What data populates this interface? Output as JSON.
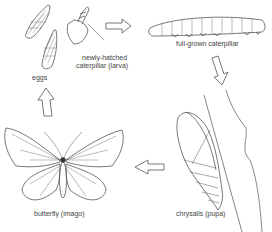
{
  "diagram": {
    "type": "life-cycle",
    "subject": "butterfly",
    "stages": [
      {
        "id": "eggs",
        "label": "eggs"
      },
      {
        "id": "larva",
        "label_line1": "newly-hatched",
        "label_line2": "caterpillar (larva)"
      },
      {
        "id": "caterpillar",
        "label": "full-grown caterpillar"
      },
      {
        "id": "pupa",
        "label": "chrysalis (pupa)"
      },
      {
        "id": "imago",
        "label": "butterfly (imago)"
      }
    ],
    "arrows": [
      {
        "from": "larva",
        "to": "caterpillar",
        "direction": "right"
      },
      {
        "from": "caterpillar",
        "to": "pupa",
        "direction": "down"
      },
      {
        "from": "pupa",
        "to": "imago",
        "direction": "left"
      },
      {
        "from": "imago",
        "to": "eggs",
        "direction": "up"
      }
    ],
    "colors": {
      "line": "#555555",
      "text": "#444444",
      "background": "#ffffff"
    }
  }
}
